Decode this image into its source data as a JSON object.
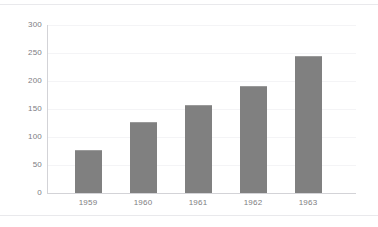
{
  "chart_data": {
    "type": "bar",
    "title": "",
    "subtitle": "",
    "xlabel": "",
    "ylabel": "",
    "categories": [
      "1959",
      "1960",
      "1961",
      "1962",
      "1963"
    ],
    "values": [
      77,
      127,
      157,
      191,
      245
    ],
    "series": [
      {
        "name": "Series 1",
        "values": [
          77,
          127,
          157,
          191,
          245
        ]
      }
    ],
    "ylim": [
      0,
      300
    ],
    "yticks": [
      0,
      50,
      100,
      150,
      200,
      250,
      300
    ],
    "ytick_labels": [
      "0",
      "50",
      "100",
      "150",
      "200",
      "250",
      "300"
    ],
    "grid": true,
    "grid_axis": "y",
    "legend": false,
    "legend_position": "none",
    "annotations": [],
    "colors": {
      "bar_fill": "#808080",
      "bar_edge": "#9a9a9a",
      "gridline": "#f4f4f6",
      "axis_line": "#d3d3d7",
      "tick_label": "#7d7d82",
      "background": "#ffffff",
      "frame_rule": "#e9e9ec"
    }
  }
}
